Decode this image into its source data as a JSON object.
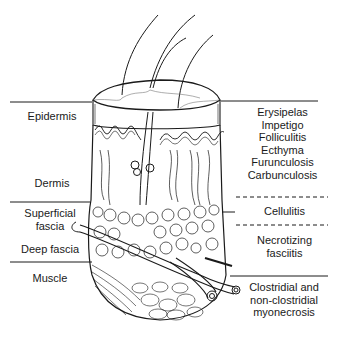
{
  "diagram": {
    "type": "skin cross-section with infection layers",
    "layers_left": [
      {
        "id": "epidermis",
        "label": "Epidermis"
      },
      {
        "id": "dermis",
        "label": "Dermis"
      },
      {
        "id": "superficial-fascia",
        "label_line1": "Superficial",
        "label_line2": "fascia"
      },
      {
        "id": "deep-fascia",
        "label": "Deep fascia"
      },
      {
        "id": "muscle",
        "label": "Muscle"
      }
    ],
    "infections_right": {
      "epidermis_dermis": [
        "Erysipelas",
        "Impetigo",
        "Folliculitis",
        "Ecthyma",
        "Furunculosis",
        "Carbunculosis"
      ],
      "superficial_fascia_upper": "Cellulitis",
      "superficial_fascia_lower": {
        "line1": "Necrotizing",
        "line2": "fasciitis"
      },
      "muscle": {
        "line1": "Clostridial and",
        "line2": "non-clostridial",
        "line3": "myonecrosis"
      }
    },
    "colors": {
      "line": "#1a1a1a",
      "text": "#1a1a1a",
      "background": "#ffffff"
    }
  }
}
